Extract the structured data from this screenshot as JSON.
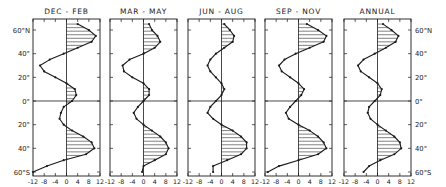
{
  "chart_data": {
    "type": "line",
    "title": "",
    "xlabel": "",
    "ylabel": "Latitude",
    "xlim": [
      -12,
      12
    ],
    "ylim": [
      -60,
      65
    ],
    "x_ticks": [
      "-12",
      "-8",
      "-4",
      "0",
      "4",
      "8",
      "12"
    ],
    "y_ticks_left": [
      "60°N",
      "40°",
      "20°",
      "0°",
      "20°",
      "40°",
      "60°S"
    ],
    "y_ticks_right": [
      "60°N",
      "40°",
      "20°",
      "0°",
      "20°",
      "40°",
      "60°S"
    ],
    "latitudes": [
      65,
      60,
      55,
      50,
      45,
      40,
      35,
      30,
      25,
      20,
      15,
      10,
      5,
      0,
      -5,
      -10,
      -15,
      -20,
      -25,
      -30,
      -35,
      -40,
      -45,
      -50,
      -55,
      -60
    ],
    "series": [
      {
        "name": "DEC - FEB",
        "values": [
          4,
          8,
          10.5,
          9,
          4,
          -1,
          -6,
          -9.5,
          -8,
          -4,
          0,
          3,
          3.5,
          2,
          -1,
          -2,
          -2.5,
          -1,
          2,
          6,
          9,
          10,
          7,
          -1,
          -7,
          -12
        ]
      },
      {
        "name": "MAR - MAY",
        "values": [
          2,
          3,
          5,
          6,
          4,
          0,
          -5,
          -7.5,
          -7,
          -4,
          0,
          2,
          2,
          0,
          -2,
          -3.5,
          -2.5,
          0,
          3,
          6,
          8,
          9,
          8,
          4,
          0,
          -0.5
        ]
      },
      {
        "name": "JUN - AUG",
        "values": [
          1,
          3,
          4.5,
          4,
          1,
          -2,
          -4,
          -5,
          -4,
          -2,
          0,
          1,
          0,
          -2,
          -4,
          -5,
          -3,
          0,
          4,
          7,
          9,
          9,
          7,
          2,
          -3,
          -3
        ]
      },
      {
        "name": "SEP - NOV",
        "values": [
          3,
          7,
          10,
          9,
          4,
          -1,
          -5,
          -7,
          -6,
          -3,
          0,
          2,
          1,
          -1,
          -3,
          -4.5,
          -3.5,
          0,
          4,
          7,
          9,
          10,
          7,
          0,
          -7,
          -11
        ]
      },
      {
        "name": "ANNUAL",
        "values": [
          2,
          5,
          7.5,
          6.5,
          3,
          -1,
          -5,
          -7,
          -6,
          -3,
          0,
          1.5,
          1,
          -1,
          -3,
          -3.5,
          -2.5,
          0,
          3,
          6,
          8,
          8.5,
          6,
          1,
          -3,
          -5
        ]
      }
    ],
    "grid": false,
    "legend": "panel titles",
    "hatching": "horizontal lines where value > 0"
  },
  "labels": {
    "panel_titles": [
      "DEC - FEB",
      "MAR - MAY",
      "JUN - AUG",
      "SEP - NOV",
      "ANNUAL"
    ],
    "lat_left": [
      "60°N",
      "40°",
      "20°",
      "0°",
      "20°",
      "40°",
      "60°S"
    ],
    "lat_right": [
      "60°N",
      "40°",
      "20°",
      "0°",
      "20°",
      "40°",
      "60°S"
    ],
    "x_ticks": [
      "-12",
      "-8",
      "-4",
      "0",
      "4",
      "8",
      "12"
    ]
  }
}
